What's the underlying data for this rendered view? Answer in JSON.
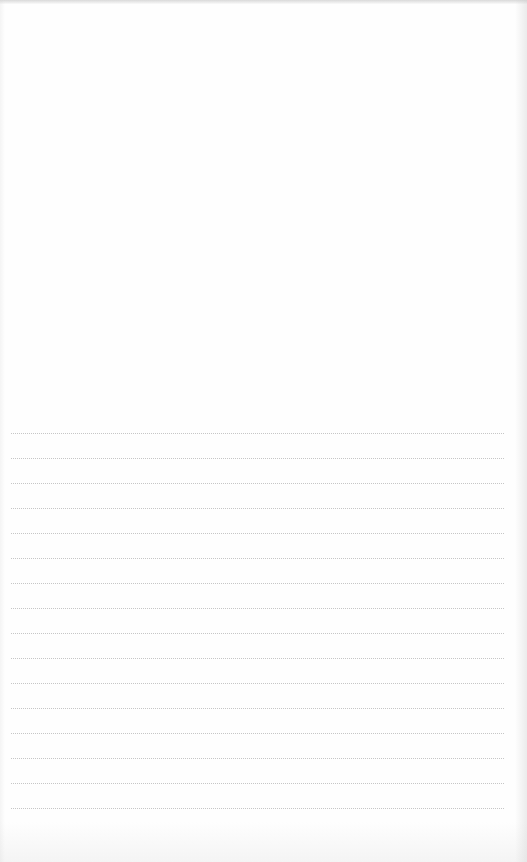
{
  "document": {
    "type": "lined-notebook-page",
    "text_content": "",
    "ruled_lines": {
      "count": 16,
      "first_line_y": 433,
      "spacing_px": 25,
      "left_x": 11,
      "right_x": 504,
      "color": "#c6c6c6"
    },
    "colors": {
      "paper": "#fefefe",
      "edge_shadow": "#c8c8c8"
    }
  }
}
